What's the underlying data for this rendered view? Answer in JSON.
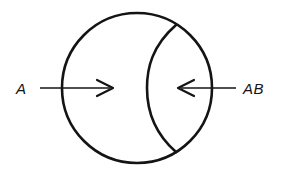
{
  "figure": {
    "title": "",
    "background_color": "#ffffff",
    "stroke_color": "#141414",
    "labels": {
      "left": "A",
      "right": "AB"
    },
    "icon_names": {
      "outer_circle": "circle-outline-shape",
      "inner_arc": "crescent-arc-shape",
      "left_arrow": "arrow-right-icon",
      "right_arrow": "arrow-left-icon"
    },
    "geometry": {
      "circle_center_x": 137,
      "circle_center_y": 88,
      "circle_radius": 75,
      "inner_arc_top_x": 176,
      "inner_arc_top_y": 25,
      "inner_arc_bottom_x": 176,
      "inner_arc_bottom_y": 152,
      "inner_arc_leftmost_x": 147,
      "arrow_axis_y": 88,
      "left_arrow_start_x": 40,
      "left_arrow_tip_x": 113,
      "right_arrow_start_x": 236,
      "right_arrow_tip_x": 178
    }
  }
}
